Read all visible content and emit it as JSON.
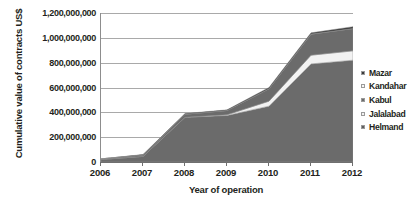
{
  "chart_data": {
    "type": "area",
    "stacked": true,
    "title": "",
    "xlabel": "Year of operation",
    "ylabel": "Cumulative value of contracts US$",
    "categories": [
      "2006",
      "2007",
      "2008",
      "2009",
      "2010",
      "2011",
      "2012"
    ],
    "x": [
      2006,
      2007,
      2008,
      2009,
      2010,
      2011,
      2012
    ],
    "ylim": [
      0,
      1200000000
    ],
    "ytick_values": [
      0,
      200000000,
      400000000,
      600000000,
      800000000,
      1000000000,
      1200000000
    ],
    "ytick_labels": [
      "0",
      "200,000,000",
      "400,000,000",
      "600,000,000",
      "800,000,000",
      "1,000,000,000",
      "1,200,000,000"
    ],
    "grid": true,
    "legend_position": "right",
    "series": [
      {
        "name": "Helmand",
        "color": "#6b6b6b",
        "values": [
          20000000,
          45000000,
          360000000,
          375000000,
          450000000,
          790000000,
          820000000
        ]
      },
      {
        "name": "Jalalabad",
        "color": "#f2f2f2",
        "values": [
          0,
          0,
          0,
          5000000,
          40000000,
          70000000,
          75000000
        ]
      },
      {
        "name": "Kabul",
        "color": "#6b6b6b",
        "values": [
          5000000,
          12000000,
          25000000,
          35000000,
          100000000,
          170000000,
          180000000
        ]
      },
      {
        "name": "Kandahar",
        "color": "#f2f2f2",
        "values": [
          0,
          0,
          0,
          0,
          0,
          0,
          0
        ]
      },
      {
        "name": "Mazar",
        "color": "#3a3a3a",
        "values": [
          0,
          3000000,
          5000000,
          5000000,
          10000000,
          10000000,
          15000000
        ]
      }
    ],
    "totals": [
      25000000,
      60000000,
      390000000,
      420000000,
      600000000,
      1040000000,
      1090000000
    ]
  },
  "legend": {
    "items": [
      {
        "label": "Mazar",
        "color": "#3a3a3a"
      },
      {
        "label": "Kandahar",
        "color": "#f7f7f7"
      },
      {
        "label": "Kabul",
        "color": "#6b6b6b"
      },
      {
        "label": "Jalalabad",
        "color": "#f2f2f2"
      },
      {
        "label": "Helmand",
        "color": "#5e5e5e"
      }
    ]
  },
  "axes": {
    "y_title": "Cumulative value of contracts US$",
    "x_title": "Year of operation"
  },
  "colors": {
    "grid": "#a9a9a9",
    "axis": "#6f6f6f",
    "fill_dark": "#6b6b6b",
    "fill_darkest": "#2f2f2f",
    "fill_light": "#f2f2f2",
    "text": "#231f20"
  }
}
